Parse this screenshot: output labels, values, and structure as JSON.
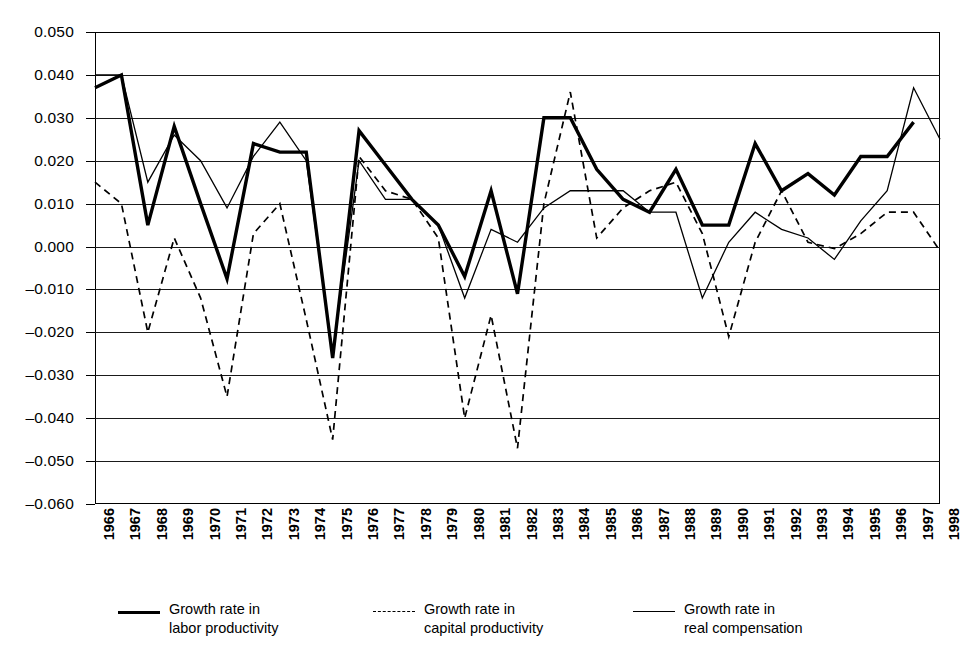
{
  "chart_data": {
    "type": "line",
    "title": "",
    "xlabel": "",
    "ylabel": "",
    "ylim": [
      -0.06,
      0.05
    ],
    "ytick_step": 0.01,
    "grid": true,
    "legend_position": "bottom",
    "categories": [
      "1966",
      "1967",
      "1968",
      "1969",
      "1970",
      "1971",
      "1972",
      "1973",
      "1974",
      "1975",
      "1976",
      "1977",
      "1978",
      "1979",
      "1980",
      "1981",
      "1982",
      "1983",
      "1984",
      "1985",
      "1986",
      "1987",
      "1988",
      "1989",
      "1990",
      "1991",
      "1992",
      "1993",
      "1994",
      "1995",
      "1996",
      "1997",
      "1998"
    ],
    "ytick_labels": [
      "0.050",
      "0.040",
      "0.030",
      "0.020",
      "0.010",
      "0.000",
      "–0.010",
      "–0.020",
      "–0.030",
      "–0.040",
      "–0.050",
      "–0.060"
    ],
    "ytick_values": [
      0.05,
      0.04,
      0.03,
      0.02,
      0.01,
      0.0,
      -0.01,
      -0.02,
      -0.03,
      -0.04,
      -0.05,
      -0.06
    ],
    "series": [
      {
        "name": "Growth rate in labor productivity",
        "style": "solid-thick",
        "values": [
          0.037,
          0.04,
          0.005,
          0.028,
          0.01,
          -0.0075,
          0.024,
          0.022,
          0.022,
          -0.026,
          0.027,
          0.019,
          0.011,
          0.005,
          -0.007,
          0.013,
          -0.011,
          0.03,
          0.03,
          0.018,
          0.011,
          0.008,
          0.018,
          0.005,
          0.005,
          0.024,
          0.013,
          0.017,
          0.012,
          0.021,
          0.021,
          0.029,
          null
        ]
      },
      {
        "name": "Growth rate in capital productivity",
        "style": "dashed",
        "values": [
          0.015,
          0.01,
          -0.02,
          0.002,
          -0.012,
          -0.035,
          0.003,
          0.01,
          -0.017,
          -0.045,
          0.021,
          0.013,
          0.011,
          0.002,
          -0.04,
          -0.016,
          -0.047,
          0.01,
          0.036,
          0.002,
          0.009,
          0.013,
          0.015,
          0.003,
          -0.021,
          0.001,
          0.013,
          0.001,
          -0.0005,
          0.003,
          0.008,
          0.008,
          -0.001
        ]
      },
      {
        "name": "Growth rate in real compensation",
        "style": "solid-thin",
        "values": [
          0.04,
          0.04,
          0.015,
          0.026,
          0.02,
          0.009,
          0.021,
          0.029,
          0.02,
          -0.025,
          0.02,
          0.011,
          0.011,
          0.005,
          -0.012,
          0.004,
          0.001,
          0.009,
          0.013,
          0.013,
          0.013,
          0.008,
          0.008,
          -0.012,
          0.001,
          0.008,
          0.004,
          0.002,
          -0.003,
          0.006,
          0.013,
          0.037,
          0.025
        ]
      }
    ]
  },
  "legend": {
    "items": [
      {
        "line1": "Growth rate in",
        "line2": "labor productivity",
        "style": "sw-thick"
      },
      {
        "line1": "Growth rate in",
        "line2": "capital productivity",
        "style": "sw-dash"
      },
      {
        "line1": "Growth rate in",
        "line2": "real compensation",
        "style": "sw-thin"
      }
    ]
  }
}
